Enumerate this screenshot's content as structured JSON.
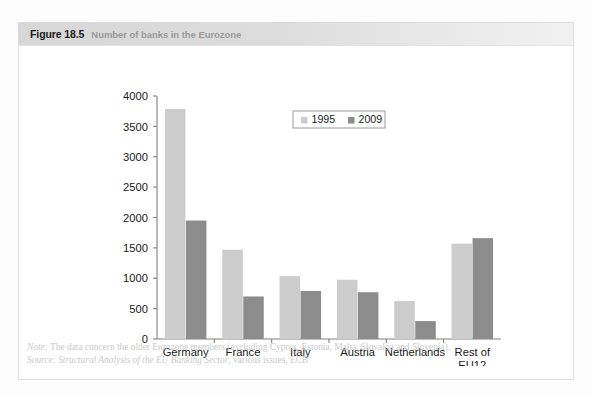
{
  "figure": {
    "number": "Figure 18.5",
    "caption": "Number of banks in the Eurozone"
  },
  "footnotes": {
    "note_label": "Note:",
    "note_text": "The data concern the older Eurozone members (excluding Cyprus, Estonia, Malta, Slovakia and Slovenia).",
    "source_label": "Source:",
    "source_title": "Structural Analysis of the EU Banking Sector",
    "source_rest": ", various issues, ECB"
  },
  "colors": {
    "series_1995": "#cccccc",
    "series_2009": "#8c8c8c",
    "axis": "#808080",
    "text": "#1a1a1a",
    "header_band": "#d9d9d9",
    "caption_gray": "#9a9a9a",
    "footnote_gray": "#c9c9c9"
  },
  "chart_data": {
    "type": "bar",
    "title": "Number of banks in the Eurozone",
    "xlabel": "",
    "ylabel": "",
    "ylim": [
      0,
      4000
    ],
    "yticks": [
      0,
      500,
      1000,
      1500,
      2000,
      2500,
      3000,
      3500,
      4000
    ],
    "ytick_labels": [
      "0",
      "500",
      "1000",
      "1500",
      "2000",
      "2500",
      "3000",
      "3500",
      "4000"
    ],
    "grid": false,
    "legend_position": "upper center",
    "categories": [
      "Germany",
      "France",
      "Italy",
      "Austria",
      "Netherlands",
      "Rest of\nEU12"
    ],
    "category_labels": [
      "Germany",
      "France",
      "Italy",
      "Austria",
      "Netherlands",
      "Rest of EU12"
    ],
    "series": [
      {
        "name": "1995",
        "color": "#cccccc",
        "values": [
          3785,
          1470,
          1035,
          975,
          625,
          1570
        ]
      },
      {
        "name": "2009",
        "color": "#8c8c8c",
        "values": [
          1950,
          700,
          790,
          770,
          295,
          1660
        ]
      }
    ]
  }
}
